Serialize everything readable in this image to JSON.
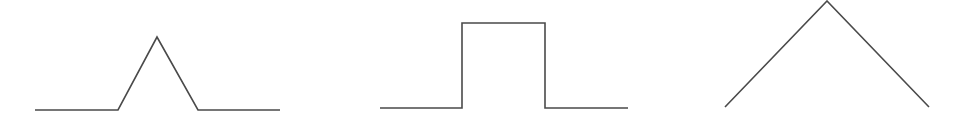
{
  "diagram": {
    "stroke_color": "#4a4a4a",
    "stroke_width": 1.6,
    "shapes": [
      {
        "name": "triangular-pulse",
        "points": [
          [
            35,
            110
          ],
          [
            118,
            110
          ],
          [
            157,
            37
          ],
          [
            198,
            110
          ],
          [
            280,
            110
          ]
        ]
      },
      {
        "name": "rectangular-pulse",
        "points": [
          [
            380,
            108
          ],
          [
            462,
            108
          ],
          [
            462,
            23
          ],
          [
            545,
            23
          ],
          [
            545,
            108
          ],
          [
            628,
            108
          ]
        ]
      },
      {
        "name": "inverted-v-peak",
        "points": [
          [
            725,
            107
          ],
          [
            827,
            1
          ],
          [
            929,
            107
          ]
        ]
      }
    ]
  }
}
